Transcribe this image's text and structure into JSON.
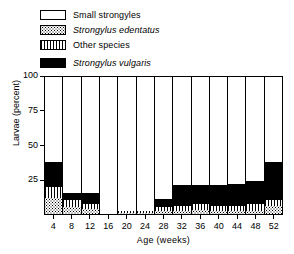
{
  "legend": {
    "items": [
      {
        "label": "Small strongyles",
        "swatch": "white-swatch-icon",
        "italic": false,
        "key": "small_strongyles"
      },
      {
        "label": "Strongylus edentatus",
        "swatch": "stipple-swatch-icon",
        "italic": true,
        "key": "strongylus_edentatus"
      },
      {
        "label": "Other species",
        "swatch": "vertical-stripe-swatch-icon",
        "italic": false,
        "key": "other_species"
      },
      {
        "label": "Strongylus vulgaris",
        "swatch": "black-swatch-icon",
        "italic": true,
        "key": "strongylus_vulgaris"
      }
    ]
  },
  "axes": {
    "y_title": "Larvae (percent)",
    "x_title": "Age (weeks)",
    "y_ticks": [
      "100",
      "75",
      "50",
      "25"
    ],
    "y_tick_values": [
      100,
      75,
      50,
      25
    ],
    "x_ticks": [
      "4",
      "8",
      "12",
      "16",
      "20",
      "24",
      "28",
      "32",
      "36",
      "40",
      "44",
      "48",
      "52"
    ]
  },
  "chart_data": {
    "type": "bar",
    "stacked": true,
    "title": "",
    "subtitle": "",
    "xlabel": "Age (weeks)",
    "ylabel": "Larvae (percent)",
    "ylim": [
      0,
      100
    ],
    "grid": false,
    "legend_position": "top-left",
    "categories": [
      "4",
      "8",
      "12",
      "16",
      "20",
      "24",
      "28",
      "32",
      "36",
      "40",
      "44",
      "48",
      "52"
    ],
    "series": [
      {
        "name": "Strongylus edentatus",
        "pattern": "stipple",
        "values": [
          12,
          5,
          4,
          0,
          1,
          1,
          2,
          2,
          3,
          2,
          2,
          2,
          6
        ]
      },
      {
        "name": "Other species",
        "pattern": "vertical-stripes",
        "values": [
          8,
          5,
          3,
          0,
          1,
          1,
          3,
          4,
          4,
          4,
          4,
          5,
          4
        ]
      },
      {
        "name": "Strongylus vulgaris",
        "pattern": "solid-black",
        "values": [
          18,
          5,
          8,
          0,
          0,
          0,
          6,
          15,
          14,
          15,
          16,
          17,
          28
        ]
      },
      {
        "name": "Small strongyles",
        "pattern": "white",
        "values": [
          62,
          85,
          85,
          100,
          98,
          98,
          89,
          79,
          79,
          79,
          78,
          76,
          62
        ]
      }
    ]
  }
}
